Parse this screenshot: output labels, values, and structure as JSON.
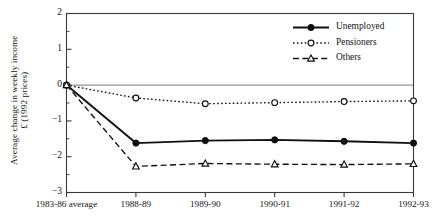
{
  "chart_data": {
    "type": "line",
    "title": "",
    "xlabel": "",
    "ylabel": "Average change in weekly income £ (1992 prices)",
    "ylabel_line1": "Average change in weekly income",
    "ylabel_line2": "£ (1992 prices)",
    "categories": [
      "1983-86 average",
      "1988-89",
      "1989-90",
      "1990-91",
      "1991-92",
      "1992-93"
    ],
    "ylim": [
      -3,
      2
    ],
    "yticks": [
      2,
      1,
      0,
      -1,
      -2,
      -3
    ],
    "ytick_labels": [
      "2",
      "1",
      "0",
      "−1",
      "−2",
      "−3"
    ],
    "grid": false,
    "zero_line": true,
    "legend_position": "top-right",
    "series": [
      {
        "name": "Unemployed",
        "values": [
          0,
          -1.62,
          -1.55,
          -1.53,
          -1.57,
          -1.62
        ],
        "line_style": "solid",
        "marker": "filled-circle",
        "color": "#101010"
      },
      {
        "name": "Pensioners",
        "values": [
          0,
          -0.36,
          -0.52,
          -0.49,
          -0.46,
          -0.44
        ],
        "line_style": "dotted",
        "marker": "open-circle",
        "color": "#101010"
      },
      {
        "name": "Others",
        "values": [
          0,
          -2.27,
          -2.19,
          -2.21,
          -2.22,
          -2.2
        ],
        "line_style": "dashed",
        "marker": "open-triangle",
        "color": "#101010"
      }
    ]
  },
  "axis": {
    "ytick_labels": [
      "2",
      "1",
      "0",
      "−1",
      "−2",
      "−3"
    ],
    "xtick_labels": [
      "1983-86 average",
      "1988-89",
      "1989-90",
      "1990-91",
      "1991-92",
      "1992-93"
    ]
  },
  "legend": {
    "items": [
      {
        "label": "Unemployed"
      },
      {
        "label": "Pensioners"
      },
      {
        "label": "Others"
      }
    ]
  },
  "colors": {
    "ink": "#101010",
    "axis": "#3a3a3a",
    "background": "#ffffff"
  }
}
